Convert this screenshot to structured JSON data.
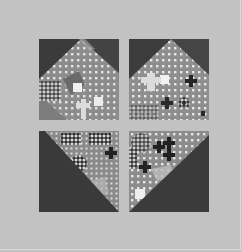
{
  "image": {
    "description": "Photograph of a quilt block made of four squares arranged in a 2x2 grid on a light gray background; each square combines dark solid fabric and a gray patterned fabric with white dots and dark crosses",
    "colors": {
      "background": "#c2c2c2",
      "dark_fabric": "#3b3b3b",
      "pattern_base": "#8c8c8c",
      "pattern_dot": "#e6e6e6",
      "pattern_cross": "#262626"
    },
    "blocks": [
      {
        "position": "top-left",
        "shape": "patterned peak (house) with dark top corners"
      },
      {
        "position": "top-right",
        "shape": "patterned peak with dark top corners"
      },
      {
        "position": "bottom-left",
        "shape": "dark lower-left triangle, patterned upper-right"
      },
      {
        "position": "bottom-right",
        "shape": "dark lower-right triangle, patterned upper-left"
      }
    ]
  }
}
